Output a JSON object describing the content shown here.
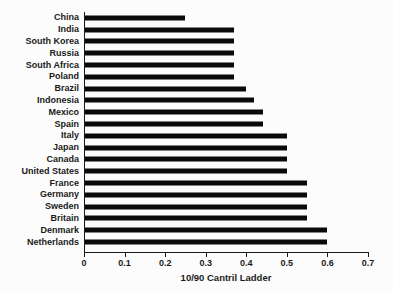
{
  "chart_data": {
    "type": "bar",
    "orientation": "horizontal",
    "title": "",
    "xlabel": "10/90 Cantril Ladder",
    "ylabel": "",
    "categories": [
      "China",
      "India",
      "South Korea",
      "Russia",
      "South Africa",
      "Poland",
      "Brazil",
      "Indonesia",
      "Mexico",
      "Spain",
      "Italy",
      "Japan",
      "Canada",
      "United States",
      "France",
      "Germany",
      "Sweden",
      "Britain",
      "Denmark",
      "Netherlands"
    ],
    "values": [
      0.25,
      0.37,
      0.37,
      0.37,
      0.37,
      0.37,
      0.4,
      0.42,
      0.44,
      0.44,
      0.5,
      0.5,
      0.5,
      0.5,
      0.55,
      0.55,
      0.55,
      0.55,
      0.6,
      0.6
    ],
    "xlim": [
      0,
      0.7
    ],
    "xticks": [
      0,
      0.1,
      0.2,
      0.3,
      0.4,
      0.5,
      0.6,
      0.7
    ],
    "xtick_labels": [
      "0",
      "0.1",
      "0.2",
      "0.3",
      "0.4",
      "0.5",
      "0.6",
      "0.7"
    ],
    "grid": false,
    "legend": "none",
    "colors": {
      "bar": "#0a0a0a",
      "axis": "#1a1a1a",
      "text": "#1a1a1a",
      "background": "#fcfcfc"
    }
  }
}
